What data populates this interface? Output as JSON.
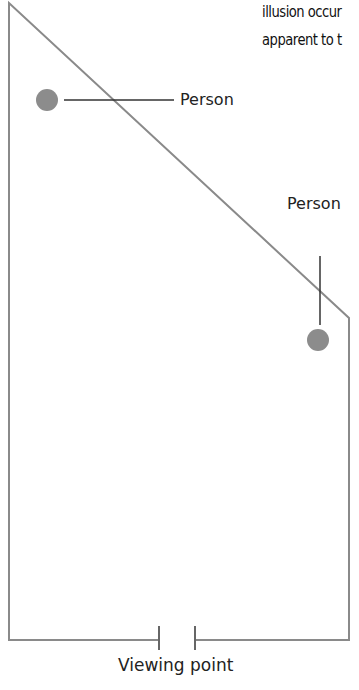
{
  "caption": {
    "line1": "illusion occur",
    "line2": "apparent to t"
  },
  "labels": {
    "person_1": "Person",
    "person_2": "Person",
    "viewing_point": "Viewing point"
  },
  "colors": {
    "room_outline": "#8a8a8a",
    "person_dot": "#8c8c8c",
    "leader_line": "#333333",
    "text": "#222222"
  }
}
